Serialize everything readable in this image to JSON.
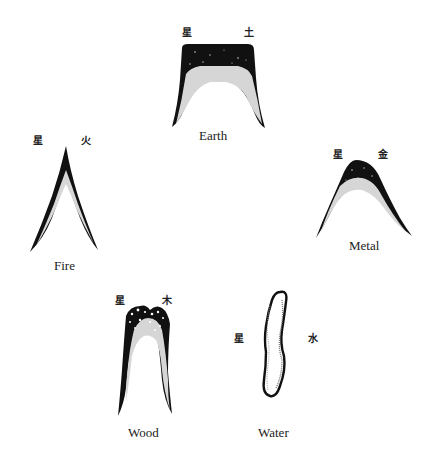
{
  "diagram": {
    "type": "five-element mountain forms",
    "elements": [
      {
        "id": "earth",
        "label": "Earth",
        "char_left": "星",
        "char_right": "土",
        "shape": "flat-topped plateau mountain"
      },
      {
        "id": "fire",
        "label": "Fire",
        "char_left": "星",
        "char_right": "火",
        "shape": "sharp pointed peak"
      },
      {
        "id": "metal",
        "label": "Metal",
        "char_left": "星",
        "char_right": "金",
        "shape": "rounded dome mountain"
      },
      {
        "id": "wood",
        "label": "Wood",
        "char_left": "星",
        "char_right": "木",
        "shape": "tall narrow mountain with rounded top"
      },
      {
        "id": "water",
        "label": "Water",
        "char_left": "星",
        "char_right": "水",
        "shape": "wavy sinuous vertical form"
      }
    ]
  },
  "colors": {
    "ink": "#111111",
    "shade": "#9a9a9a",
    "background": "#ffffff"
  }
}
